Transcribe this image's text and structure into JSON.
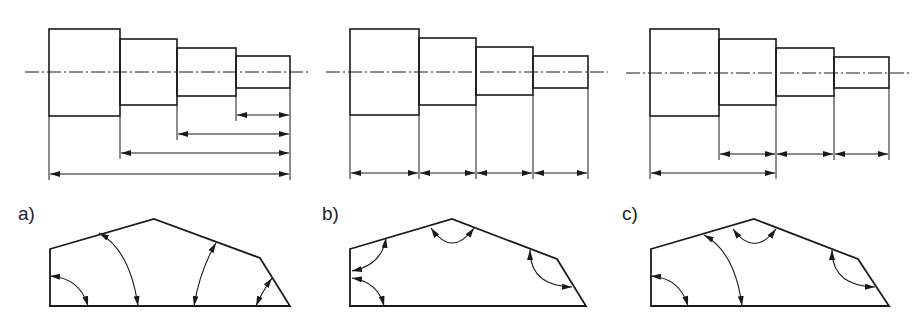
{
  "figure": {
    "stroke_color": "#1a1a1a",
    "background": "#ffffff",
    "panels": [
      {
        "label": "a)",
        "shaft": {
          "steps_x": [
            49,
            120,
            177,
            236,
            290
          ],
          "steps_y": [
            [
              29,
              116
            ],
            [
              39,
              105
            ],
            [
              48,
              96
            ],
            [
              56,
              88
            ]
          ],
          "centerline_y": 72,
          "dimensions": [
            {
              "x1": 236,
              "x2": 290,
              "y": 115,
              "ext_from": 236
            },
            {
              "x1": 177,
              "x2": 290,
              "y": 134,
              "ext_from": 177
            },
            {
              "x1": 120,
              "x2": 290,
              "y": 153,
              "ext_from": 120
            },
            {
              "x1": 49,
              "x2": 290,
              "y": 174,
              "ext_from": 49
            }
          ],
          "dimension_style": "chain from right end (parallel)"
        },
        "polygon": [
          [
            50,
            249
          ],
          [
            154,
            219
          ],
          [
            260,
            258
          ],
          [
            290,
            306
          ],
          [
            50,
            306
          ]
        ],
        "angle_arcs": [
          {
            "from": [
              50,
              276
            ],
            "to": [
              88,
              306
            ],
            "c": [
              80,
              278
            ]
          },
          {
            "from": [
              99,
              233
            ],
            "to": [
              138,
              306
            ],
            "c": [
              130,
              250
            ]
          },
          {
            "from": [
              216,
              243
            ],
            "to": [
              194,
              306
            ],
            "c": [
              200,
              270
            ]
          },
          {
            "from": [
              272,
              278
            ],
            "to": [
              256,
              306
            ],
            "c": [
              262,
              292
            ]
          }
        ]
      },
      {
        "label": "b)",
        "shaft": {
          "steps_x": [
            350,
            419,
            476,
            533,
            588
          ],
          "steps_y": [
            [
              29,
              115
            ],
            [
              38,
              105
            ],
            [
              47,
              95
            ],
            [
              56,
              88
            ]
          ],
          "centerline_y": 72,
          "dimensions": [
            {
              "x1": 350,
              "x2": 419,
              "y": 173
            },
            {
              "x1": 419,
              "x2": 476,
              "y": 173
            },
            {
              "x1": 476,
              "x2": 533,
              "y": 173
            },
            {
              "x1": 533,
              "x2": 588,
              "y": 173
            }
          ],
          "dimension_style": "chain (series)"
        },
        "polygon": [
          [
            350,
            249
          ],
          [
            452,
            219
          ],
          [
            557,
            259
          ],
          [
            586,
            306
          ],
          [
            350,
            306
          ]
        ],
        "angle_arcs": [
          {
            "from": [
              386,
              238
            ],
            "to": [
              352,
              271
            ],
            "c": [
              382,
              265
            ]
          },
          {
            "from": [
              352,
              278
            ],
            "to": [
              384,
              306
            ],
            "c": [
              378,
              282
            ]
          },
          {
            "from": [
              431,
              228
            ],
            "to": [
              474,
              228
            ],
            "c": [
              452,
              258
            ]
          },
          {
            "from": [
              530,
              250
            ],
            "to": [
              572,
              287
            ],
            "c": [
              530,
              286
            ]
          }
        ]
      },
      {
        "label": "c)",
        "shaft": {
          "steps_x": [
            650,
            719,
            776,
            834,
            889
          ],
          "steps_y": [
            [
              29,
              116
            ],
            [
              39,
              105
            ],
            [
              48,
              96
            ],
            [
              57,
              88
            ]
          ],
          "centerline_y": 73,
          "dimensions": [
            {
              "x1": 719,
              "x2": 776,
              "y": 154
            },
            {
              "x1": 776,
              "x2": 834,
              "y": 154
            },
            {
              "x1": 834,
              "x2": 889,
              "y": 154
            },
            {
              "x1": 650,
              "x2": 776,
              "y": 173
            }
          ],
          "dimension_style": "combined"
        },
        "polygon": [
          [
            651,
            249
          ],
          [
            754,
            219
          ],
          [
            858,
            259
          ],
          [
            889,
            306
          ],
          [
            651,
            306
          ]
        ],
        "angle_arcs": [
          {
            "from": [
              651,
              276
            ],
            "to": [
              688,
              306
            ],
            "c": [
              680,
              278
            ]
          },
          {
            "from": [
              704,
              235
            ],
            "to": [
              742,
              306
            ],
            "c": [
              735,
              252
            ]
          },
          {
            "from": [
              733,
              229
            ],
            "to": [
              776,
              229
            ],
            "c": [
              754,
              258
            ]
          },
          {
            "from": [
              832,
              250
            ],
            "to": [
              875,
              287
            ],
            "c": [
              832,
              286
            ]
          }
        ]
      }
    ]
  }
}
